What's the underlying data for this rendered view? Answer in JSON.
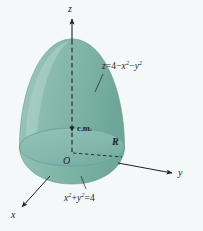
{
  "figure": {
    "kind": "3d-solid-paraboloid-diagram",
    "background_color": "#f4f8f9",
    "ink_color": "#211f1f",
    "solid": {
      "surface_fill": "#7fb5a6",
      "surface_highlight": "#9cc6ba",
      "base_fill": "#86b8ae",
      "base_rim": "#6fa698",
      "wall_fill": "#7cb2a4",
      "edge_color": "#5f9b8c"
    },
    "axes": [
      {
        "name": "z-axis",
        "label": "z",
        "direction": "up"
      },
      {
        "name": "y-axis",
        "label": "y",
        "direction": "right"
      },
      {
        "name": "x-axis",
        "label": "x",
        "direction": "lower-left"
      }
    ],
    "origin_label": "O",
    "radius_label": "R",
    "center_of_mass_label": "c.m.",
    "surface_equation": {
      "lhs": "z",
      "equals": "=",
      "const": "4",
      "minus1": "−",
      "term1_base": "x",
      "term1_exp": "2",
      "minus2": "−",
      "term2_base": "y",
      "term2_exp": "2"
    },
    "boundary_equation": {
      "t1_base": "x",
      "t1_exp": "2",
      "plus": "+",
      "t2_base": "y",
      "t2_exp": "2",
      "equals": "=",
      "rhs": "4"
    }
  }
}
